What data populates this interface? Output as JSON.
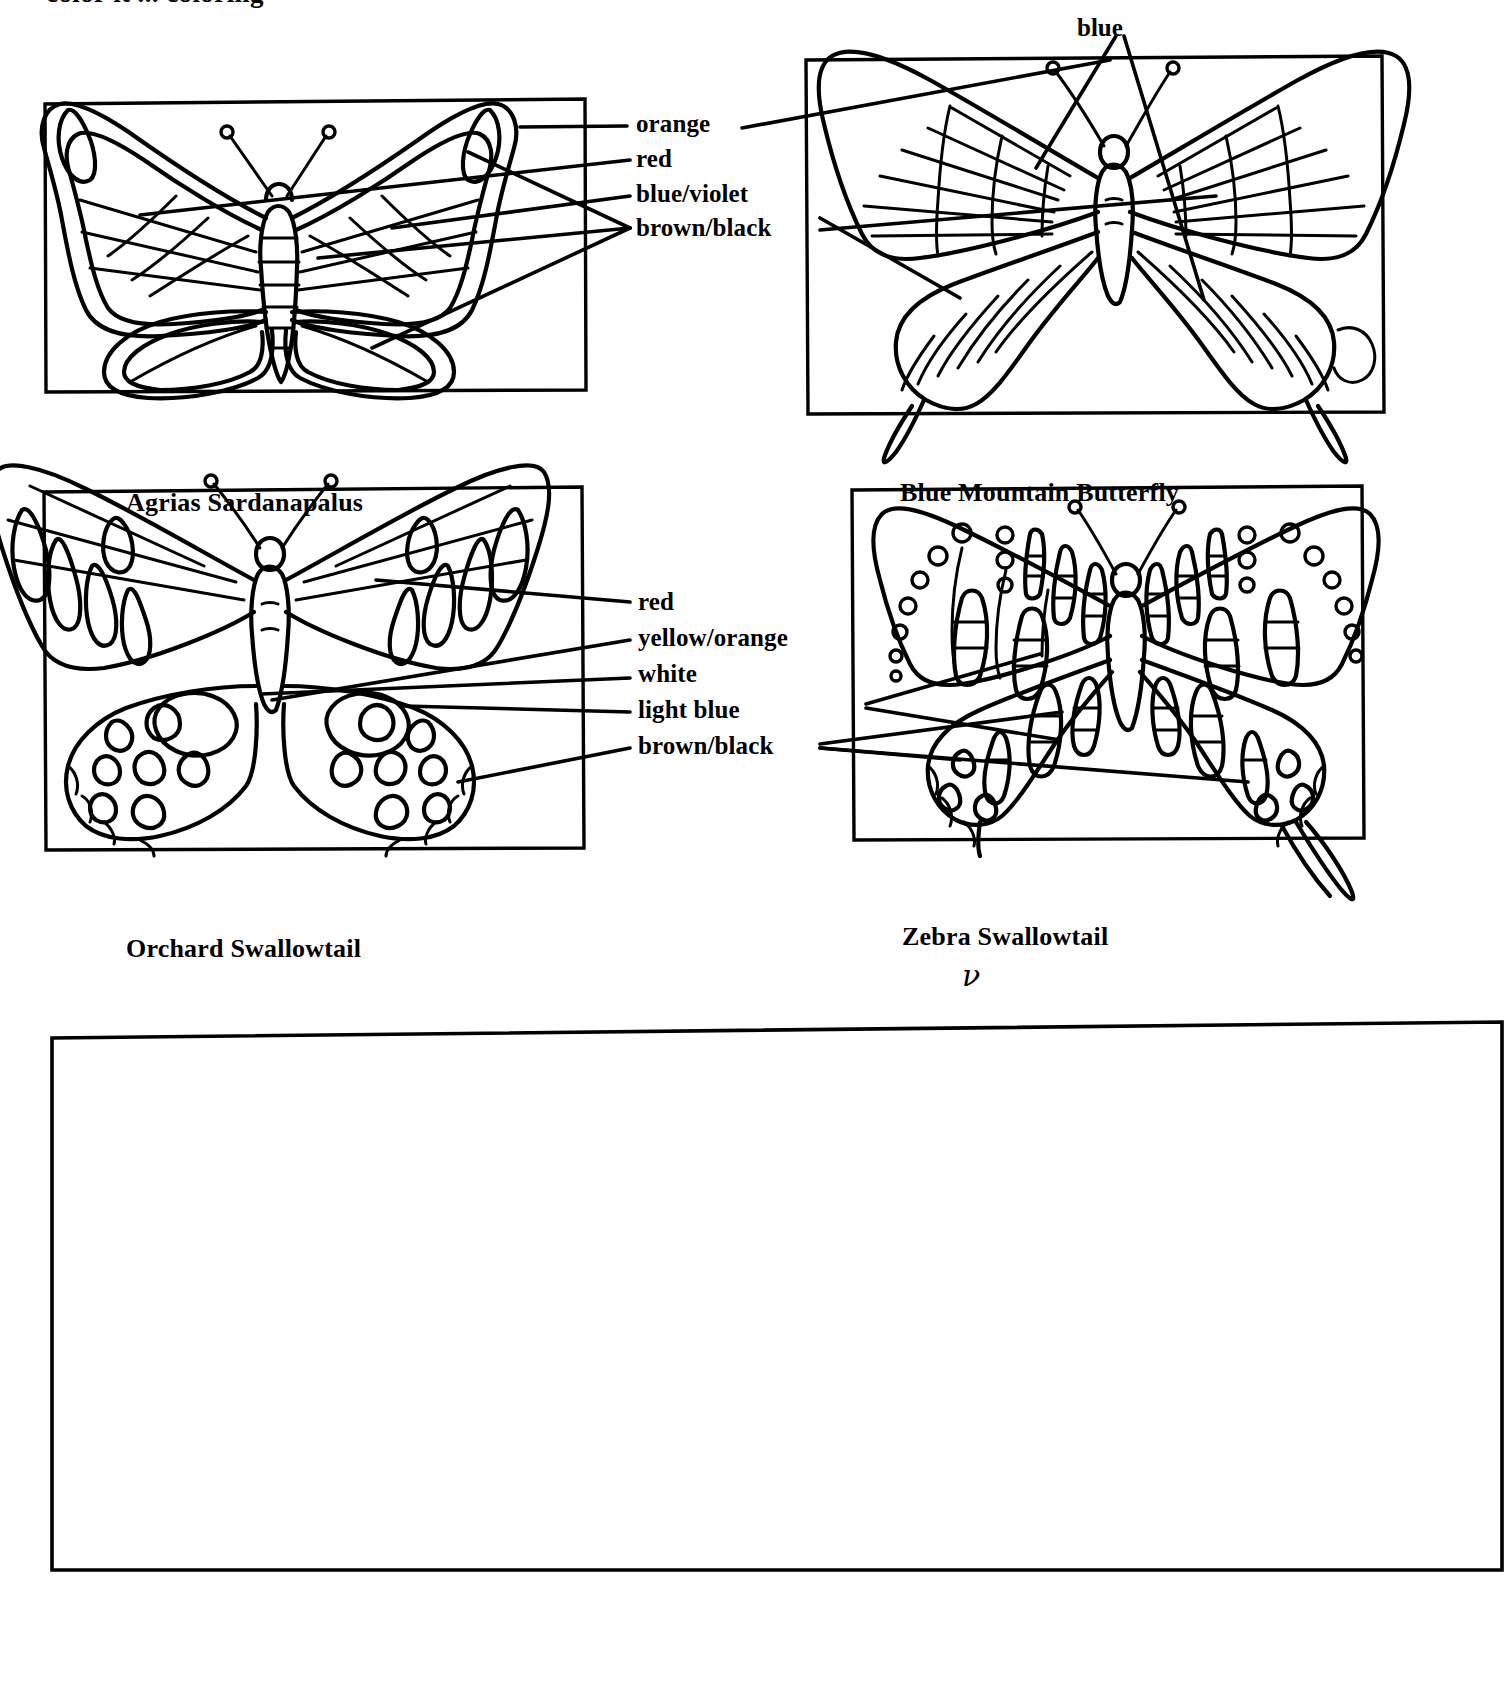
{
  "worksheet": {
    "clipped_heading": "color it ... coloring",
    "bottom_box_note": ""
  },
  "specimens": [
    {
      "id": "agrias-sardanapalus",
      "name": "Agrias Sardanapalus",
      "position": "top-left",
      "color_legend": [
        "orange",
        "red",
        "blue/violet",
        "brown/black"
      ]
    },
    {
      "id": "blue-mountain-butterfly",
      "name": "Blue Mountain Butterfly",
      "position": "top-right",
      "color_legend": [
        "blue",
        "orange",
        "red",
        "blue/violet",
        "brown/black"
      ]
    },
    {
      "id": "orchard-swallowtail",
      "name": "Orchard Swallowtail",
      "position": "bottom-left",
      "color_legend": [
        "red",
        "yellow/orange",
        "white",
        "light blue",
        "brown/black"
      ]
    },
    {
      "id": "zebra-swallowtail",
      "name": "Zebra Swallowtail",
      "position": "bottom-right",
      "color_legend": [
        "red",
        "yellow/orange",
        "white",
        "light blue",
        "brown/black"
      ],
      "annotation": "ν"
    }
  ],
  "legend_top": {
    "blue": "blue",
    "items": [
      "orange",
      "red",
      "blue/violet",
      "brown/black"
    ]
  },
  "legend_bottom": {
    "items": [
      "red",
      "yellow/orange",
      "white",
      "light blue",
      "brown/black"
    ]
  },
  "colors": {
    "ink": "#000000",
    "paper": "#ffffff"
  }
}
